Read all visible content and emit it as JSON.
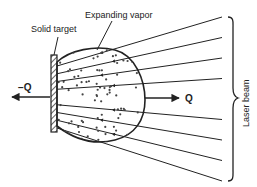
{
  "diagram": {
    "labels": {
      "expanding_vapor": "Expanding vapor",
      "solid_target": "Solid target",
      "minus_q": "−Q",
      "plus_q": "Q",
      "laser_beam": "Laser beam"
    },
    "laser_line_count": 9,
    "colors": {
      "ink": "#222222",
      "background": "#ffffff"
    }
  }
}
